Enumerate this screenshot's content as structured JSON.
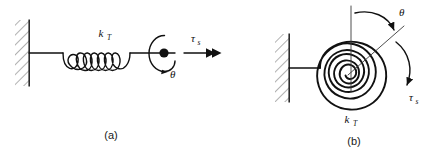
{
  "figure": {
    "title_present": false,
    "background_color": "#ffffff",
    "ink_color": "#111111",
    "panels": [
      {
        "id": "a",
        "caption": "(a)",
        "description": "linear helical torsion spring anchored to a fixed wall with a rotating hub",
        "labels": {
          "stiffness_symbol": "k",
          "stiffness_subscript": "T",
          "torque_symbol": "τ",
          "torque_subscript": "s",
          "angle_symbol": "θ"
        },
        "elements": [
          "fixed-wall-hatching",
          "horizontal-connector-rod",
          "helical-coil-spring",
          "hub-dot",
          "rotation-ellipse-arrow",
          "torque-double-arrow"
        ],
        "spring_coils": 6
      },
      {
        "id": "b",
        "caption": "(b)",
        "description": "flat spiral (clock) torsion spring anchored to a fixed wall",
        "labels": {
          "stiffness_symbol": "k",
          "stiffness_subscript": "T",
          "torque_symbol": "τ",
          "torque_subscript": "s",
          "angle_symbol": "θ"
        },
        "elements": [
          "fixed-wall-hatching",
          "horizontal-connector-rod",
          "spiral-spring",
          "vertical-reference-line",
          "rotated-radial-line",
          "theta-arc-arrow",
          "torque-arc-arrow"
        ],
        "spiral_turns": 3
      }
    ]
  }
}
